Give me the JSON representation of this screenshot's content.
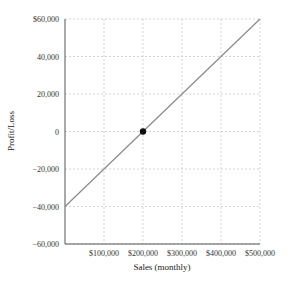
{
  "chart_data": {
    "type": "line",
    "title": "",
    "xlabel": "Sales (monthly)",
    "ylabel": "Profit/Loss",
    "xlim": [
      0,
      500000
    ],
    "ylim": [
      -60000,
      60000
    ],
    "x_ticks": [
      100000,
      200000,
      300000,
      400000,
      500000
    ],
    "x_tick_labels": [
      "$100,000",
      "$200,000",
      "$300,000",
      "$400,000",
      "$500,000"
    ],
    "y_ticks": [
      60000,
      40000,
      20000,
      0,
      -20000,
      -40000,
      -60000
    ],
    "y_tick_labels": [
      "$60,000",
      "40,000",
      "20,000",
      "0",
      "−20,000",
      "−40,000",
      "−60,000"
    ],
    "grid": true,
    "grid_style": "dashed",
    "series": [
      {
        "name": "Profit/Loss",
        "color": "#8a8a8a",
        "x": [
          0,
          500000
        ],
        "y": [
          -40000,
          60000
        ]
      }
    ],
    "points": [
      {
        "name": "break-even",
        "x": 200000,
        "y": 0,
        "color": "#111111"
      }
    ],
    "legend": null
  },
  "layout": {
    "plot": {
      "left": 65,
      "top": 19,
      "right": 260,
      "bottom": 244
    }
  }
}
